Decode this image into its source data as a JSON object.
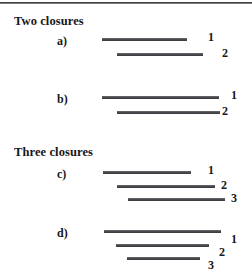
{
  "figure": {
    "background_color": "#ffffff",
    "bar_color": "#4b4b4f",
    "text_color": "#17171a",
    "width": 252,
    "height": 277
  },
  "groups": [
    {
      "heading": "Two closures",
      "heading_x": 14,
      "heading_y": 14,
      "panels": [
        {
          "label": "a)",
          "label_x": 57,
          "label_y": 34,
          "bars": [
            {
              "number": "1",
              "x": 102,
              "y": 38,
              "length": 85,
              "num_x": 208,
              "num_y": 30
            },
            {
              "number": "2",
              "x": 117,
              "y": 53,
              "length": 86,
              "num_x": 222,
              "num_y": 46
            }
          ]
        },
        {
          "label": "b)",
          "label_x": 57,
          "label_y": 92,
          "bars": [
            {
              "number": "1",
              "x": 102,
              "y": 96,
              "length": 117,
              "num_x": 231,
              "num_y": 88
            },
            {
              "number": "2",
              "x": 117,
              "y": 111,
              "length": 103,
              "num_x": 222,
              "num_y": 104
            }
          ]
        }
      ]
    },
    {
      "heading": "Three closures",
      "heading_x": 14,
      "heading_y": 145,
      "panels": [
        {
          "label": "c)",
          "label_x": 57,
          "label_y": 167,
          "bars": [
            {
              "number": "1",
              "x": 103,
              "y": 171,
              "length": 88,
              "num_x": 208,
              "num_y": 163
            },
            {
              "number": "2",
              "x": 117,
              "y": 185,
              "length": 98,
              "num_x": 221,
              "num_y": 178
            },
            {
              "number": "3",
              "x": 128,
              "y": 198,
              "length": 97,
              "num_x": 231,
              "num_y": 191
            }
          ]
        },
        {
          "label": "d)",
          "label_x": 57,
          "label_y": 226,
          "bars": [
            {
              "number": "1",
              "x": 104,
              "y": 230,
              "length": 117,
              "num_x": 231,
              "num_y": 232
            },
            {
              "number": "2",
              "x": 116,
              "y": 244,
              "length": 93,
              "num_x": 219,
              "num_y": 245
            },
            {
              "number": "3",
              "x": 127,
              "y": 257,
              "length": 73,
              "num_x": 208,
              "num_y": 258
            }
          ]
        }
      ]
    }
  ],
  "chart_data": {
    "type": "bar",
    "panels": [
      {
        "id": "a",
        "group": "Two closures",
        "intervals": [
          {
            "label": "1",
            "start": 102,
            "end": 187
          },
          {
            "label": "2",
            "start": 117,
            "end": 203
          }
        ]
      },
      {
        "id": "b",
        "group": "Two closures",
        "intervals": [
          {
            "label": "1",
            "start": 102,
            "end": 219
          },
          {
            "label": "2",
            "start": 117,
            "end": 220
          }
        ]
      },
      {
        "id": "c",
        "group": "Three closures",
        "intervals": [
          {
            "label": "1",
            "start": 103,
            "end": 191
          },
          {
            "label": "2",
            "start": 117,
            "end": 215
          },
          {
            "label": "3",
            "start": 128,
            "end": 225
          }
        ]
      },
      {
        "id": "d",
        "group": "Three closures",
        "intervals": [
          {
            "label": "1",
            "start": 104,
            "end": 221
          },
          {
            "label": "2",
            "start": 116,
            "end": 209
          },
          {
            "label": "3",
            "start": 127,
            "end": 200
          }
        ]
      }
    ],
    "xlabel": "",
    "ylabel": "",
    "grid": false,
    "legend": "none"
  }
}
